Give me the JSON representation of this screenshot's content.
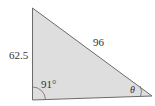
{
  "diagram": {
    "type": "triangle",
    "side_left_label": "62.5",
    "side_hypotenuse_label": "96",
    "angle_bottom_left_label": "91°",
    "angle_bottom_right_label": "θ",
    "colors": {
      "fill": "#dedede",
      "stroke": "#6b6b6b",
      "text": "#333333"
    }
  }
}
